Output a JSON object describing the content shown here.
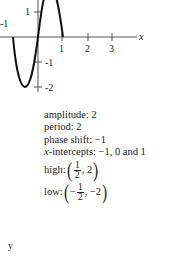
{
  "graph": {
    "function_description": "sine curve, amplitude 2, period 2, phase shift -1",
    "x_axis_label": "x",
    "x_ticks": [
      "1",
      "2",
      "3"
    ],
    "y_ticks": [
      "1",
      "-1",
      "-2"
    ],
    "corner_label": "-1"
  },
  "info": {
    "amplitude": "amplitude: 2",
    "period": "period: 2",
    "phase_shift": "phase shift: −1",
    "x_intercepts_label": "x",
    "x_intercepts": "-intercepts: −1, 0 and 1",
    "high_label": "high: ",
    "high_num": "1",
    "high_den": "2",
    "high_y": ", 2",
    "low_label": "low: ",
    "low_sign": "−",
    "low_num": "1",
    "low_den": "2",
    "low_y": ", −2"
  },
  "footer": {
    "y_label": "y"
  }
}
